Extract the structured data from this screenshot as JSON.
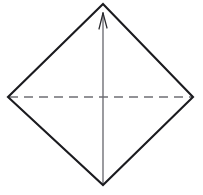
{
  "figure": {
    "background_color": "#ffffff",
    "outline_color": "#1b1b1f",
    "hidden_edge_color": "#6f6f74",
    "axis_color": "#6a6a70",
    "vertices": {
      "apex": {
        "label": "apex",
        "x": 103,
        "y": 4
      },
      "left": {
        "label": "left-vertex",
        "x": 8,
        "y": 97
      },
      "right": {
        "label": "right-vertex",
        "x": 193,
        "y": 97
      },
      "bottom": {
        "label": "bottom-vertex",
        "x": 103,
        "y": 185
      }
    },
    "edges": {
      "outline_path": "M 103 4 L 8 97 L 103 185 L 193 97 Z",
      "hidden_edge_path": "M 9 97 L 192 97",
      "hidden_edge_dash_pattern": "9 6",
      "axis_path": "M 103 184 L 103 13",
      "arrow_barb_left_path": "M 103 13 L 99 29",
      "arrow_barb_right_path": "M 103 13 L 107 28"
    },
    "labels": []
  }
}
